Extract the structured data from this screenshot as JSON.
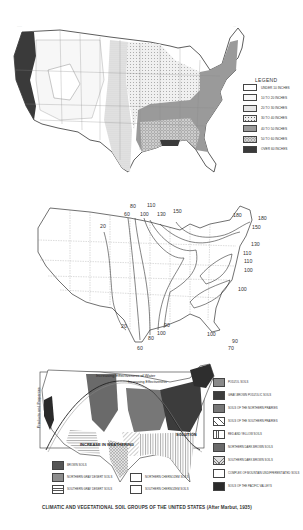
{
  "page": {
    "marks": [
      "·····",
      "···"
    ]
  },
  "map1": {
    "title": "Average annual precipitation",
    "legend_title": "LEGEND",
    "legend": [
      {
        "label": "UNDER 10 INCHES",
        "fill": "#ffffff",
        "pattern": "none"
      },
      {
        "label": "10 TO 20 INCHES",
        "fill": "#f7f7f7",
        "pattern": "none"
      },
      {
        "label": "20 TO 30 INCHES",
        "fill": "#e6e6e6",
        "pattern": "fine-dots"
      },
      {
        "label": "30 TO 40 INCHES",
        "fill": "#eeeeee",
        "pattern": "dots"
      },
      {
        "label": "40 TO 50 INCHES",
        "fill": "#9a9a9a",
        "pattern": "none"
      },
      {
        "label": "50 TO 60 INCHES",
        "fill": "#d0d0d0",
        "pattern": "circles"
      },
      {
        "label": "OVER 60 INCHES",
        "fill": "#3a3a3a",
        "pattern": "none"
      }
    ]
  },
  "map2": {
    "title": "Isoline map",
    "contour_labels": [
      {
        "text": "20",
        "pos": "west-plains-north"
      },
      {
        "text": "20",
        "pos": "texas-south"
      },
      {
        "text": "60",
        "pos": "north-central-1"
      },
      {
        "text": "80",
        "pos": "north-central-2"
      },
      {
        "text": "100",
        "pos": "north-central-3"
      },
      {
        "text": "110",
        "pos": "north-central-4"
      },
      {
        "text": "130",
        "pos": "great-lakes-west"
      },
      {
        "text": "150",
        "pos": "great-lakes"
      },
      {
        "text": "180",
        "pos": "new-england-west"
      },
      {
        "text": "180",
        "pos": "maine-east"
      },
      {
        "text": "150",
        "pos": "new-england"
      },
      {
        "text": "130",
        "pos": "mid-atlantic-1"
      },
      {
        "text": "110",
        "pos": "mid-atlantic-2"
      },
      {
        "text": "110",
        "pos": "mid-atlantic-3"
      },
      {
        "text": "100",
        "pos": "mid-atlantic-4"
      },
      {
        "text": "100",
        "pos": "carolina-coast"
      },
      {
        "text": "60",
        "pos": "texas-tip"
      },
      {
        "text": "80",
        "pos": "gulf-1"
      },
      {
        "text": "100",
        "pos": "gulf-2"
      },
      {
        "text": "90",
        "pos": "gulf-3"
      },
      {
        "text": "100",
        "pos": "florida-west"
      },
      {
        "text": "90",
        "pos": "florida-east"
      },
      {
        "text": "70",
        "pos": "florida-tip"
      }
    ]
  },
  "map3": {
    "annotations": {
      "top_1": "Increasing Effectiveness of Water",
      "top_2": "Increasing Effectiveness",
      "side": "Products and Properties",
      "bottom": "INCREASE IN WEATHERING",
      "right": "SOLUTION"
    },
    "legend_right": [
      {
        "label": "PODZOL SOILS",
        "fill": "#8a8a8a",
        "pattern": "none"
      },
      {
        "label": "GRAY-BROWN PODZOLIC SOILS",
        "fill": "#3c3c3c",
        "pattern": "none"
      },
      {
        "label": "SOILS OF THE NORTHERN PRAIRIES",
        "fill": "#777777",
        "pattern": "none"
      },
      {
        "label": "SOILS OF THE SOUTHERN PRAIRIES",
        "fill": "#ffffff",
        "pattern": "diagonal"
      },
      {
        "label": "RED AND YELLOW SOILS",
        "fill": "#ffffff",
        "pattern": "vertical"
      },
      {
        "label": "NORTHERN DARK BROWN SOILS",
        "fill": "#6a6a6a",
        "pattern": "none"
      },
      {
        "label": "SOUTHERN DARK BROWN SOILS",
        "fill": "#dddddd",
        "pattern": "cross"
      },
      {
        "label": "COMPLEX OF MOUNTAIN UNDIFFERENTIATED SOILS",
        "fill": "#ffffff",
        "pattern": "none"
      },
      {
        "label": "SOILS OF THE PACIFIC VALLEYS",
        "fill": "#2a2a2a",
        "pattern": "none"
      }
    ],
    "legend_bottom": [
      {
        "label": "BROWN SOILS",
        "fill": "#555555",
        "pattern": "none"
      },
      {
        "label": "NORTHERN GRAY DESERT SOILS",
        "fill": "#8d8d8d",
        "pattern": "none"
      },
      {
        "label": "SOUTHERN GRAY DESERT SOILS",
        "fill": "#ffffff",
        "pattern": "horizontal"
      },
      {
        "label": "NORTHERN CHERNOZEM SOILS",
        "fill": "#ffffff",
        "pattern": "none"
      },
      {
        "label": "SOUTHERN CHERNOZEM SOILS",
        "fill": "#ffffff",
        "pattern": "none"
      }
    ],
    "caption": "CLIMATIC AND VEGETATIONAL SOIL GROUPS OF THE UNITED STATES (After Marbut, 1935)"
  }
}
